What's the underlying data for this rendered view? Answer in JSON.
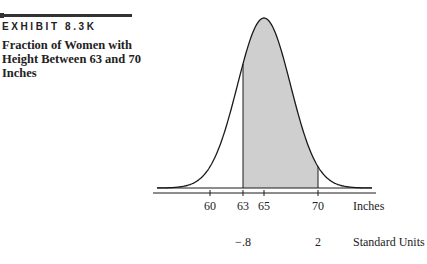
{
  "header": {
    "exhibit_label": "EXHIBIT 8.3K",
    "caption": "Fraction of Women with Height Between 63 and 70 Inches"
  },
  "colors": {
    "ink": "#1a1a1a",
    "shade": "#cfcfcf",
    "background": "#ffffff"
  },
  "chart_data": {
    "type": "area",
    "title": "Fraction of Women with Height Between 63 and 70 Inches",
    "subtitle": "EXHIBIT 8.3K",
    "distribution": "normal",
    "mean": 65,
    "sd": 2.5,
    "shaded_range": [
      63,
      70
    ],
    "xlabel": "Inches",
    "secondary_xlabel": "Standard Units",
    "x_ticks": [
      60,
      63,
      65,
      70
    ],
    "x_tick_labels": [
      "60",
      "63",
      "65",
      "70"
    ],
    "standard_unit_labels": [
      {
        "at_inches": 63,
        "label": "−.8"
      },
      {
        "at_inches": 70,
        "label": "2"
      }
    ],
    "grid": false,
    "legend": null
  },
  "axis": {
    "ticks": [
      {
        "label": "60",
        "x": 210
      },
      {
        "label": "63",
        "x": 243
      },
      {
        "label": "65",
        "x": 264
      },
      {
        "label": "70",
        "x": 318
      }
    ],
    "primary_unit": "Inches",
    "standard": [
      {
        "label": "−.8",
        "x": 243
      },
      {
        "label": "2",
        "x": 318
      }
    ],
    "secondary_unit": "Standard Units"
  }
}
